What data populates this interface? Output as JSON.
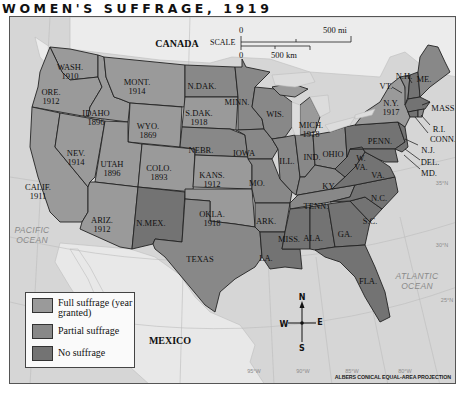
{
  "title": "WOMEN'S SUFFRAGE, 1919",
  "colors": {
    "full_suffrage": "#9a9a9a",
    "partial_suffrage": "#888888",
    "no_suffrage": "#737373",
    "foreign_land": "#e9e9e9",
    "water": "#d6d6d6",
    "border": "#222222"
  },
  "countries": {
    "canada": "CANADA",
    "mexico": "MEXICO"
  },
  "oceans": {
    "pacific": "PACIFIC\nOCEAN",
    "pacific_line1": "PACIFIC",
    "pacific_line2": "OCEAN",
    "atlantic_line1": "ATLANTIC",
    "atlantic_line2": "OCEAN"
  },
  "scale": {
    "label": "SCALE",
    "zero_top": "0",
    "zero_bottom": "0",
    "miles": "500 mi",
    "km": "500 km"
  },
  "compass": {
    "n": "N",
    "s": "S",
    "e": "E",
    "w": "W"
  },
  "projection": "ALBERS CONICAL EQUAL-AREA PROJECTION",
  "graticule": {
    "lon": [
      "95°W",
      "90°W",
      "85°W",
      "80°W"
    ],
    "lat": [
      "30°N",
      "25°N",
      "35°N"
    ]
  },
  "legend": [
    {
      "label": "Full suffrage (year granted)",
      "status": "full"
    },
    {
      "label": "Partial suffrage",
      "status": "partial"
    },
    {
      "label": "No suffrage",
      "status": "none"
    }
  ],
  "states": [
    {
      "abbr": "WASH.",
      "year": "1910",
      "status": "full"
    },
    {
      "abbr": "ORE.",
      "year": "1912",
      "status": "full"
    },
    {
      "abbr": "CALIF.",
      "year": "1911",
      "status": "full"
    },
    {
      "abbr": "IDAHO",
      "year": "1896",
      "status": "full"
    },
    {
      "abbr": "NEV.",
      "year": "1914",
      "status": "full"
    },
    {
      "abbr": "MONT.",
      "year": "1914",
      "status": "full"
    },
    {
      "abbr": "WYO.",
      "year": "1869",
      "status": "full"
    },
    {
      "abbr": "UTAH",
      "year": "1896",
      "status": "full"
    },
    {
      "abbr": "COLO.",
      "year": "1893",
      "status": "full"
    },
    {
      "abbr": "ARIZ.",
      "year": "1912",
      "status": "full"
    },
    {
      "abbr": "N.MEX.",
      "year": "",
      "status": "none"
    },
    {
      "abbr": "N.DAK.",
      "year": "",
      "status": "partial"
    },
    {
      "abbr": "S.DAK.",
      "year": "1918",
      "status": "full"
    },
    {
      "abbr": "NEBR.",
      "year": "",
      "status": "partial"
    },
    {
      "abbr": "KANS.",
      "year": "1912",
      "status": "full"
    },
    {
      "abbr": "OKLA.",
      "year": "1918",
      "status": "full"
    },
    {
      "abbr": "TEXAS",
      "year": "",
      "status": "partial"
    },
    {
      "abbr": "MINN.",
      "year": "",
      "status": "partial"
    },
    {
      "abbr": "IOWA",
      "year": "",
      "status": "partial"
    },
    {
      "abbr": "MO.",
      "year": "",
      "status": "partial"
    },
    {
      "abbr": "ARK.",
      "year": "",
      "status": "partial"
    },
    {
      "abbr": "LA.",
      "year": "",
      "status": "none"
    },
    {
      "abbr": "WIS.",
      "year": "",
      "status": "partial"
    },
    {
      "abbr": "ILL.",
      "year": "",
      "status": "partial"
    },
    {
      "abbr": "MICH.",
      "year": "1918",
      "status": "full"
    },
    {
      "abbr": "IND.",
      "year": "",
      "status": "partial"
    },
    {
      "abbr": "OHIO",
      "year": "",
      "status": "partial"
    },
    {
      "abbr": "KY.",
      "year": "",
      "status": "partial"
    },
    {
      "abbr": "TENN.",
      "year": "",
      "status": "partial"
    },
    {
      "abbr": "MISS.",
      "year": "",
      "status": "none"
    },
    {
      "abbr": "ALA.",
      "year": "",
      "status": "none"
    },
    {
      "abbr": "GA.",
      "year": "",
      "status": "none"
    },
    {
      "abbr": "FLA.",
      "year": "",
      "status": "none"
    },
    {
      "abbr": "S.C.",
      "year": "",
      "status": "none"
    },
    {
      "abbr": "N.C.",
      "year": "",
      "status": "none"
    },
    {
      "abbr": "VA.",
      "year": "",
      "status": "none"
    },
    {
      "abbr": "W. VA.",
      "year": "",
      "status": "none"
    },
    {
      "abbr": "PENN.",
      "year": "",
      "status": "none"
    },
    {
      "abbr": "N.Y.",
      "year": "1917",
      "status": "full"
    },
    {
      "abbr": "VT.",
      "year": "",
      "status": "partial"
    },
    {
      "abbr": "N.H.",
      "year": "",
      "status": "none"
    },
    {
      "abbr": "ME.",
      "year": "",
      "status": "partial"
    },
    {
      "abbr": "MASS.",
      "year": "",
      "status": "none"
    },
    {
      "abbr": "R.I.",
      "year": "",
      "status": "partial"
    },
    {
      "abbr": "CONN.",
      "year": "",
      "status": "none"
    },
    {
      "abbr": "N.J.",
      "year": "",
      "status": "none"
    },
    {
      "abbr": "DEL.",
      "year": "",
      "status": "none"
    },
    {
      "abbr": "MD.",
      "year": "",
      "status": "none"
    }
  ]
}
